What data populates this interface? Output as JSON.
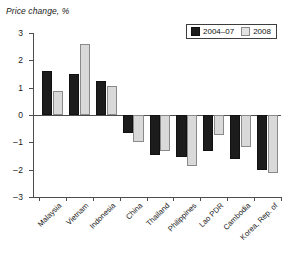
{
  "chart_data": {
    "type": "bar",
    "title": "",
    "ylabel": "Price change, %",
    "xlabel": "",
    "ylim": [
      -3,
      3
    ],
    "yticks": [
      3,
      2,
      1,
      0,
      -1,
      -2,
      -3
    ],
    "ytick_labels": [
      "3",
      "2",
      "1",
      "0",
      "-1",
      "-2",
      "-3"
    ],
    "grid": false,
    "legend_position": "top-right",
    "categories": [
      "Malaysia",
      "Vietnam",
      "Indonesia",
      "China",
      "Thailand",
      "Philippines",
      "Lao PDR",
      "Cambodia",
      "Korea, Rep. of"
    ],
    "series": [
      {
        "name": "2004–07",
        "color": "#1c1c1c",
        "values": [
          1.62,
          1.5,
          1.25,
          -0.67,
          -1.48,
          -1.52,
          -1.3,
          -1.6,
          -2.0
        ]
      },
      {
        "name": "2008",
        "color": "#d9d9d9",
        "values": [
          0.88,
          2.6,
          1.05,
          -1.0,
          -1.3,
          -1.85,
          -0.72,
          -1.18,
          -2.12
        ]
      }
    ]
  },
  "legend": {
    "entries": [
      {
        "label": "2004–07",
        "swatch": "black-square-icon"
      },
      {
        "label": "2008",
        "swatch": "light-square-icon"
      }
    ]
  }
}
